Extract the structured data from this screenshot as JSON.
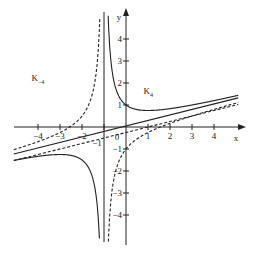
{
  "chart_data": {
    "type": "line",
    "title": "",
    "xlabel": "x",
    "ylabel": "y",
    "xlim": [
      -5,
      5
    ],
    "ylim": [
      -5,
      5
    ],
    "grid": false,
    "origin_label": "0",
    "x_ticks": [
      -4,
      -3,
      -2,
      -1,
      1,
      2,
      3,
      4
    ],
    "x_tick_labels": [
      "−4",
      "−3",
      "−2",
      "−1",
      "1",
      "2",
      "3",
      "4"
    ],
    "y_ticks": [
      4,
      3,
      2,
      1,
      -1,
      -2,
      -3,
      -4
    ],
    "y_tick_labels": [
      "4",
      "3",
      "2",
      "1",
      "−1",
      "−2",
      "−3",
      "−4"
    ],
    "vertical_asymptote_x": -1,
    "series": [
      {
        "name": "K_4",
        "label_main": "K",
        "label_sub": "4",
        "style": "solid",
        "a": 1,
        "description": "y = x/4 + 1/(x+1)",
        "label_at": [
          0.8,
          1.5
        ]
      },
      {
        "name": "K_-4",
        "label_main": "K",
        "label_sub": "−4",
        "style": "dashed",
        "a": -1,
        "description": "y = x/4 − 1/(x+1)",
        "label_at": [
          -4.3,
          2.1
        ]
      },
      {
        "name": "asymptote-solid",
        "style": "solid",
        "slope": 0.25,
        "intercept": 0.05
      },
      {
        "name": "asymptote-dashed",
        "style": "dashed",
        "slope": 0.25,
        "intercept": -0.25
      }
    ]
  }
}
